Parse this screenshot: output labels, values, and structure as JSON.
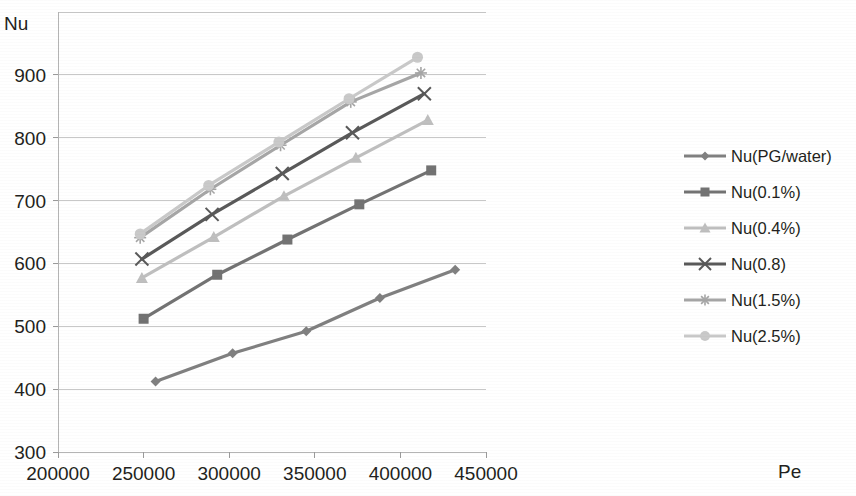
{
  "chart_data": {
    "type": "line",
    "title": "",
    "xlabel": "Pe",
    "ylabel": "Nu",
    "xlim": [
      200000,
      450000
    ],
    "ylim": [
      300,
      1000
    ],
    "grid": true,
    "legend_position": "right",
    "x_ticks": [
      "200000",
      "250000",
      "300000",
      "350000",
      "400000",
      "450000"
    ],
    "x_tick_values": [
      200000,
      250000,
      300000,
      350000,
      400000,
      450000
    ],
    "y_ticks": [
      "300",
      "400",
      "500",
      "600",
      "700",
      "800",
      "900"
    ],
    "y_tick_values": [
      300,
      400,
      500,
      600,
      700,
      800,
      900
    ],
    "series": [
      {
        "name": "Nu(PG/water)",
        "marker": "diamond",
        "color": "#808080",
        "x": [
          257000,
          302000,
          345000,
          388000,
          432000
        ],
        "values": [
          412,
          457,
          492,
          545,
          590
        ]
      },
      {
        "name": "Nu(0.1%)",
        "marker": "square",
        "color": "#737373",
        "x": [
          250000,
          293000,
          334000,
          376000,
          418000
        ],
        "values": [
          512,
          582,
          638,
          694,
          748
        ]
      },
      {
        "name": "Nu(0.4%)",
        "marker": "triangle",
        "color": "#bfbfbf",
        "x": [
          249000,
          291000,
          332000,
          374000,
          416000
        ],
        "values": [
          577,
          642,
          707,
          768,
          828
        ]
      },
      {
        "name": "Nu(0.8)",
        "marker": "cross",
        "color": "#595959",
        "x": [
          249000,
          290000,
          331000,
          372000,
          414000
        ],
        "values": [
          607,
          678,
          743,
          808,
          870
        ]
      },
      {
        "name": "Nu(1.5%)",
        "marker": "asterisk",
        "color": "#a6a6a6",
        "x": [
          248000,
          289000,
          330000,
          371000,
          412000
        ],
        "values": [
          641,
          718,
          788,
          857,
          903
        ]
      },
      {
        "name": "Nu(2.5%)",
        "marker": "circle",
        "color": "#c9c9c9",
        "x": [
          248000,
          288000,
          329000,
          370000,
          410000
        ],
        "values": [
          647,
          724,
          793,
          862,
          928
        ]
      }
    ]
  },
  "legend": {
    "items": [
      {
        "label": "Nu(PG/water)"
      },
      {
        "label": "Nu(0.1%)"
      },
      {
        "label": "Nu(0.4%)"
      },
      {
        "label": "Nu(0.8)"
      },
      {
        "label": "Nu(1.5%)"
      },
      {
        "label": "Nu(2.5%)"
      }
    ]
  },
  "labels": {
    "y_axis_title": "Nu",
    "x_axis_title": "Pe"
  }
}
